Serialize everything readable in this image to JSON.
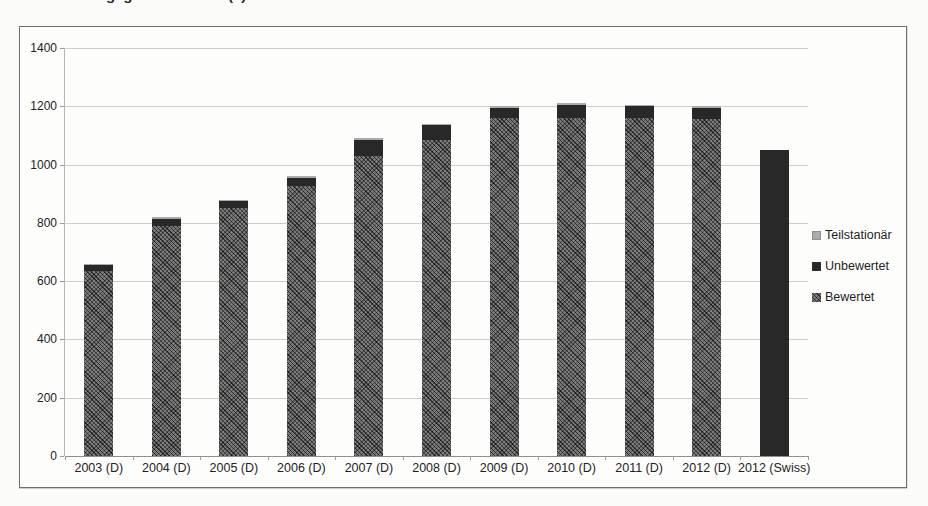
{
  "caption_fragments": [
    {
      "text": "g g",
      "left_px": 106
    },
    {
      "text": "(    )",
      "left_px": 228
    }
  ],
  "chart_data": {
    "type": "bar",
    "stacked": true,
    "title": "",
    "xlabel": "",
    "ylabel": "",
    "categories": [
      "2003 (D)",
      "2004 (D)",
      "2005 (D)",
      "2006 (D)",
      "2007 (D)",
      "2008 (D)",
      "2009 (D)",
      "2010 (D)",
      "2011 (D)",
      "2012 (D)",
      "2012 (Swiss)"
    ],
    "series": [
      {
        "name": "Bewertet",
        "color": "#565656",
        "pattern": "crosshatch",
        "values": [
          635,
          790,
          850,
          925,
          1030,
          1085,
          1160,
          1160,
          1160,
          1155,
          0
        ]
      },
      {
        "name": "Unbewertet",
        "color": "#282828",
        "pattern": "solid",
        "values": [
          20,
          25,
          25,
          30,
          55,
          50,
          35,
          45,
          40,
          40,
          1050
        ]
      },
      {
        "name": "Teilstationär",
        "color": "#ababab",
        "pattern": "solid",
        "values": [
          5,
          5,
          5,
          5,
          5,
          5,
          5,
          5,
          5,
          5,
          0
        ]
      }
    ],
    "totals": [
      660,
      820,
      880,
      960,
      1090,
      1140,
      1200,
      1210,
      1205,
      1200,
      1050
    ],
    "y_axis": {
      "min": 0,
      "max": 1400,
      "tick_step": 200,
      "ticks": [
        0,
        200,
        400,
        600,
        800,
        1000,
        1200,
        1400
      ]
    },
    "gridlines": true,
    "legend": {
      "position": "right",
      "items": [
        {
          "label": "Teilstationär",
          "series": "Teilstationär"
        },
        {
          "label": "Unbewertet",
          "series": "Unbewertet"
        },
        {
          "label": "Bewertet",
          "series": "Bewertet"
        }
      ]
    }
  }
}
